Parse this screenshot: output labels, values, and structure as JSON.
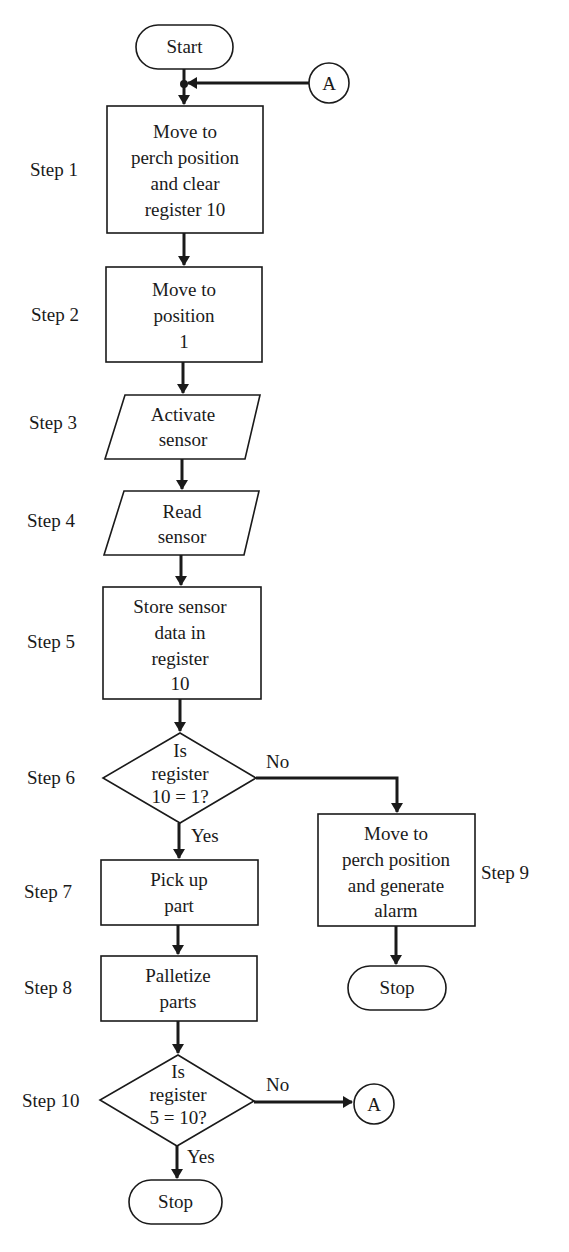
{
  "diagram": {
    "type": "flowchart",
    "nodes": {
      "start": {
        "shape": "terminal",
        "text": "Start"
      },
      "connector_a_top": {
        "shape": "connector",
        "text": "A"
      },
      "step1": {
        "step_label": "Step 1",
        "shape": "process",
        "lines": [
          "Move to",
          "perch position",
          "and clear",
          "register 10"
        ]
      },
      "step2": {
        "step_label": "Step 2",
        "shape": "process",
        "lines": [
          "Move to",
          "position",
          "1"
        ]
      },
      "step3": {
        "step_label": "Step 3",
        "shape": "input-output",
        "lines": [
          "Activate",
          "sensor"
        ]
      },
      "step4": {
        "step_label": "Step 4",
        "shape": "input-output",
        "lines": [
          "Read",
          "sensor"
        ]
      },
      "step5": {
        "step_label": "Step 5",
        "shape": "process",
        "lines": [
          "Store sensor",
          "data in",
          "register",
          "10"
        ]
      },
      "step6": {
        "step_label": "Step 6",
        "shape": "decision",
        "lines": [
          "Is",
          "register",
          "10 = 1?"
        ],
        "yes_label": "Yes",
        "no_label": "No"
      },
      "step7": {
        "step_label": "Step 7",
        "shape": "process",
        "lines": [
          "Pick up",
          "part"
        ]
      },
      "step8": {
        "step_label": "Step 8",
        "shape": "process",
        "lines": [
          "Palletize",
          "parts"
        ]
      },
      "step9": {
        "step_label": "Step 9",
        "shape": "process",
        "lines": [
          "Move to",
          "perch position",
          "and generate",
          "alarm"
        ]
      },
      "stop_alarm": {
        "shape": "terminal",
        "text": "Stop"
      },
      "step10": {
        "step_label": "Step 10",
        "shape": "decision",
        "lines": [
          "Is",
          "register",
          "5 = 10?"
        ],
        "yes_label": "Yes",
        "no_label": "No"
      },
      "connector_a_bottom": {
        "shape": "connector",
        "text": "A"
      },
      "stop_end": {
        "shape": "terminal",
        "text": "Stop"
      }
    },
    "edges": [
      [
        "start",
        "step1"
      ],
      [
        "connector_a_top",
        "step1"
      ],
      [
        "step1",
        "step2"
      ],
      [
        "step2",
        "step3"
      ],
      [
        "step3",
        "step4"
      ],
      [
        "step4",
        "step5"
      ],
      [
        "step5",
        "step6"
      ],
      [
        "step6",
        "step7",
        "Yes"
      ],
      [
        "step6",
        "step9",
        "No"
      ],
      [
        "step9",
        "stop_alarm"
      ],
      [
        "step7",
        "step8"
      ],
      [
        "step8",
        "step10"
      ],
      [
        "step10",
        "stop_end",
        "Yes"
      ],
      [
        "step10",
        "connector_a_bottom",
        "No"
      ]
    ]
  }
}
